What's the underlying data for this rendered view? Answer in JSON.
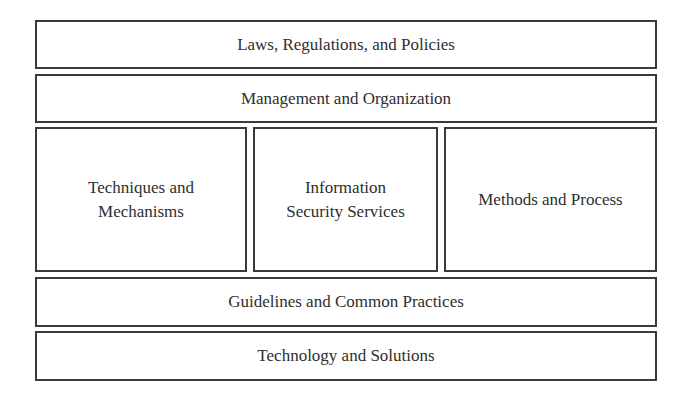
{
  "diagram": {
    "layers": [
      {
        "id": "laws",
        "label": "Laws, Regulations, and Policies"
      },
      {
        "id": "management",
        "label": "Management and Organization"
      },
      {
        "id": "middle",
        "columns": [
          {
            "id": "techniques",
            "label": "Techniques and\nMechanisms"
          },
          {
            "id": "services",
            "label": "Information\nSecurity Services"
          },
          {
            "id": "methods",
            "label": "Methods and Process"
          }
        ]
      },
      {
        "id": "guidelines",
        "label": "Guidelines and Common Practices"
      },
      {
        "id": "technology",
        "label": "Technology and Solutions"
      }
    ],
    "colors": {
      "border": "#3a3a3a",
      "text": "#2e2e2e",
      "background": "#ffffff"
    }
  }
}
